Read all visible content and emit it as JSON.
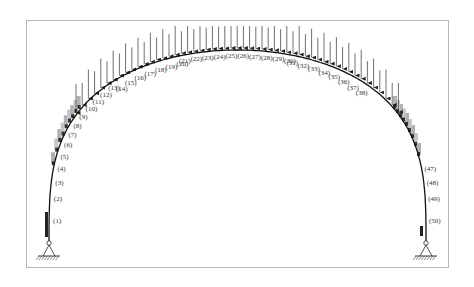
{
  "diagram": {
    "type": "arch-load-diagram",
    "arch": {
      "left_support": {
        "x": 49,
        "y": 243
      },
      "right_support": {
        "x": 426,
        "y": 243
      },
      "apex": {
        "x": 237,
        "y": 50
      },
      "stroke_color": "#111111"
    },
    "segments": [
      "(1)",
      "(2)",
      "(3)",
      "(4)",
      "(5)",
      "(6)",
      "(7)",
      "(8)",
      "(9)",
      "(10)",
      "(11)",
      "(12)",
      "(13)",
      "(14)",
      "(15)",
      "(16)",
      "(17)",
      "(18)",
      "(19)",
      "(20)",
      "(21)",
      "(22)",
      "(23)",
      "(24)",
      "(25)",
      "(26)",
      "(27)",
      "(28)",
      "(29)",
      "(30)",
      "(31)",
      "(32)",
      "(33)",
      "(34)",
      "(35)",
      "(36)",
      "(37)",
      "(38)",
      "(39)",
      "(40)",
      "(41)",
      "(42)",
      "(43)",
      "(44)",
      "(45)",
      "(46)",
      "(47)",
      "(48)",
      "(49)",
      "(50)"
    ],
    "visible_labels": [
      1,
      2,
      3,
      4,
      5,
      6,
      7,
      8,
      9,
      10,
      11,
      12,
      13,
      14,
      15,
      16,
      17,
      18,
      19,
      20,
      21,
      22,
      23,
      24,
      25,
      26,
      27,
      28,
      29,
      30,
      31,
      32,
      33,
      34,
      35,
      36,
      37,
      38,
      47,
      48,
      49,
      50
    ],
    "supports": [
      "pinned-left",
      "pinned-right"
    ],
    "load": {
      "direction": "downward",
      "arrow_color": "#222222",
      "shade_color": "#bdbdbd"
    },
    "frame_color": "#b8b8b8"
  }
}
